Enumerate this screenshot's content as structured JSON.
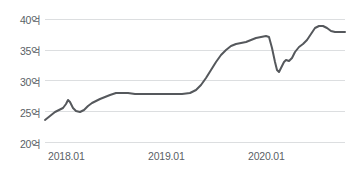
{
  "chart_data": {
    "type": "line",
    "title": "",
    "xlabel": "",
    "ylabel": "",
    "ylim": [
      20,
      40
    ],
    "ytick_labels": [
      "40억",
      "35억",
      "30억",
      "25억",
      "20억"
    ],
    "ytick_values": [
      40,
      35,
      30,
      25,
      20
    ],
    "xtick_labels": [
      "2018.01",
      "2019.01",
      "2020.01"
    ],
    "xtick_values": [
      "2018.01",
      "2019.01",
      "2020.01"
    ],
    "grid": true,
    "legend": "none",
    "unit_note": "억 (100 million KRW)",
    "series": [
      {
        "name": "",
        "color": "#55585c",
        "x": [
          "2017.10",
          "2017.11",
          "2017.12",
          "2018.01",
          "2018.02",
          "2018.03",
          "2018.04",
          "2018.05",
          "2018.06",
          "2018.07",
          "2018.08",
          "2018.09",
          "2018.10",
          "2018.11",
          "2018.12",
          "2019.01",
          "2019.02",
          "2019.03",
          "2019.04",
          "2019.05",
          "2019.06",
          "2019.07",
          "2019.08",
          "2019.09",
          "2019.10",
          "2019.11",
          "2019.12",
          "2020.01",
          "2020.02",
          "2020.03",
          "2020.04",
          "2020.05",
          "2020.06",
          "2020.07",
          "2020.08",
          "2020.09",
          "2020.10",
          "2020.11",
          "2020.12",
          "2021.01"
        ],
        "values": [
          24.0,
          24.4,
          25.0,
          25.3,
          25.6,
          26.5,
          25.5,
          25.3,
          25.4,
          26.2,
          26.8,
          27.0,
          27.6,
          27.9,
          28.0,
          28.0,
          27.9,
          27.9,
          27.9,
          27.9,
          28.0,
          28.1,
          29.2,
          31.0,
          32.6,
          34.4,
          36.0,
          36.5,
          37.2,
          37.5,
          37.4,
          34.0,
          32.2,
          33.8,
          33.5,
          34.5,
          34.4,
          36.0,
          38.6,
          38.9
        ]
      }
    ],
    "line_points": [
      [
        45,
        120
      ],
      [
        50,
        116
      ],
      [
        55,
        112
      ],
      [
        59,
        110
      ],
      [
        63,
        108
      ],
      [
        66,
        104
      ],
      [
        68,
        100
      ],
      [
        70,
        102
      ],
      [
        73,
        108
      ],
      [
        76,
        111
      ],
      [
        80,
        112
      ],
      [
        84,
        110
      ],
      [
        88,
        106
      ],
      [
        92,
        103
      ],
      [
        96,
        101
      ],
      [
        100,
        99
      ],
      [
        105,
        97
      ],
      [
        110,
        95
      ],
      [
        116,
        93
      ],
      [
        122,
        93
      ],
      [
        128,
        93
      ],
      [
        135,
        94
      ],
      [
        142,
        94
      ],
      [
        150,
        94
      ],
      [
        158,
        94
      ],
      [
        166,
        94
      ],
      [
        174,
        94
      ],
      [
        182,
        94
      ],
      [
        190,
        93
      ],
      [
        196,
        90
      ],
      [
        201,
        85
      ],
      [
        206,
        78
      ],
      [
        211,
        70
      ],
      [
        216,
        62
      ],
      [
        221,
        55
      ],
      [
        226,
        50
      ],
      [
        231,
        46
      ],
      [
        236,
        44
      ],
      [
        241,
        43
      ],
      [
        246,
        42
      ],
      [
        251,
        40
      ],
      [
        256,
        38
      ],
      [
        261,
        37
      ],
      [
        266,
        36
      ],
      [
        269,
        37
      ],
      [
        272,
        48
      ],
      [
        275,
        62
      ],
      [
        277,
        70
      ],
      [
        279,
        72
      ],
      [
        281,
        68
      ],
      [
        284,
        62
      ],
      [
        286,
        60
      ],
      [
        289,
        61
      ],
      [
        292,
        58
      ],
      [
        295,
        52
      ],
      [
        299,
        47
      ],
      [
        303,
        44
      ],
      [
        307,
        40
      ],
      [
        311,
        34
      ],
      [
        315,
        28
      ],
      [
        319,
        26
      ],
      [
        323,
        26
      ],
      [
        327,
        28
      ],
      [
        331,
        31
      ],
      [
        335,
        32
      ],
      [
        340,
        32
      ],
      [
        345,
        32
      ]
    ]
  }
}
